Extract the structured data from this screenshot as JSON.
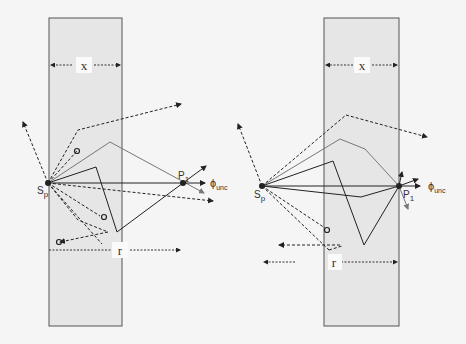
{
  "figure": {
    "panels": [
      {
        "id": "left",
        "slab_label": "x",
        "range_label": "r",
        "source_label": "S",
        "source_subscript": "p",
        "point_label": "P",
        "point_subscript": "1",
        "flux_label": "ϕ",
        "flux_subscript": "unc"
      },
      {
        "id": "right",
        "slab_label": "x",
        "range_label": "r",
        "source_label": "S",
        "source_subscript": "p",
        "point_label": "P",
        "point_subscript": "1",
        "flux_label": "ϕ",
        "flux_subscript": "unc"
      }
    ],
    "colors": {
      "slab_fill": "#e6e6e6",
      "slab_border": "#555555",
      "ray_dark": "#222222",
      "ray_gray": "#777777",
      "background": "#f5f5f5"
    }
  }
}
